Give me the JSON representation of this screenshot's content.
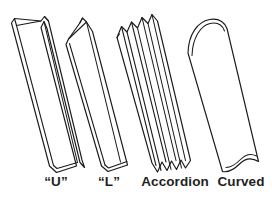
{
  "figure": {
    "background_color": "#ffffff",
    "line_color": "#1a1a1a",
    "label_color": "#231f20",
    "shapes": [
      {
        "id": "u-channel",
        "label": "“U”",
        "description": "U-shaped channel with two upright side walls and a flat base, drawn in oblique projection"
      },
      {
        "id": "l-angle",
        "label": "“L”",
        "description": "L-shaped angle with one tall vertical flange and one short horizontal foot"
      },
      {
        "id": "accordion",
        "label": "Accordion",
        "description": "Corrugated accordion profile with repeating lengthwise pleats and a zigzag end section"
      },
      {
        "id": "curved",
        "label": "Curved",
        "description": "Curved half-round profile with a domed top end and concave bottom end"
      }
    ]
  }
}
